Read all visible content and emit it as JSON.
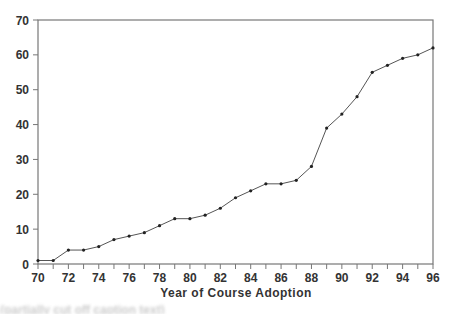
{
  "chart_data": {
    "type": "line",
    "title": "",
    "xlabel": "Year of Course Adoption",
    "ylabel": "",
    "xlim": [
      70,
      96
    ],
    "ylim": [
      0,
      70
    ],
    "grid": false,
    "legend": null,
    "x_ticks": [
      70,
      72,
      74,
      76,
      78,
      80,
      82,
      84,
      86,
      88,
      90,
      92,
      94,
      96
    ],
    "y_ticks": [
      0,
      10,
      20,
      30,
      40,
      50,
      60,
      70
    ],
    "x": [
      70,
      71,
      72,
      73,
      74,
      75,
      76,
      77,
      78,
      79,
      80,
      81,
      82,
      83,
      84,
      85,
      86,
      87,
      88,
      89,
      90,
      91,
      92,
      93,
      94,
      95,
      96
    ],
    "series": [
      {
        "name": "Cumulative adoptions",
        "marker": "dot",
        "values": [
          1,
          1,
          4,
          4,
          5,
          7,
          8,
          9,
          11,
          13,
          13,
          14,
          16,
          19,
          21,
          23,
          23,
          24,
          28,
          39,
          43,
          48,
          55,
          57,
          59,
          60,
          62
        ]
      }
    ]
  },
  "colors": {
    "line": "#555555",
    "marker": "#222222",
    "axis": "#777777",
    "text": "#333333"
  },
  "caption": {
    "text": "(partially cut off caption text)"
  }
}
